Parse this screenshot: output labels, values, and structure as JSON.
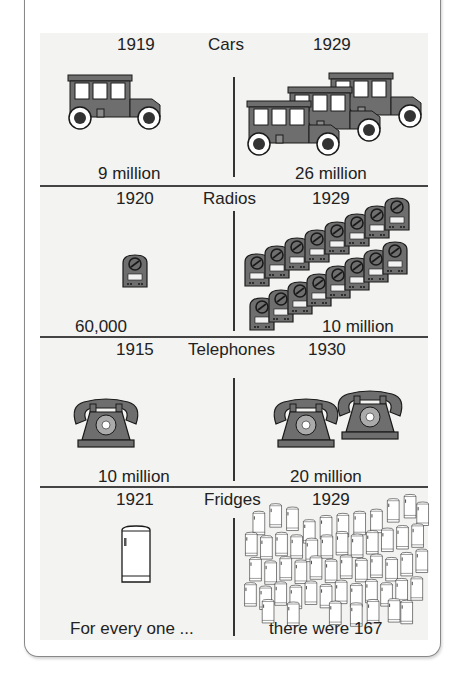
{
  "intro_text": "the 1920s.",
  "colors": {
    "panel_bg": "#f3f3f1",
    "icon_fill": "#6e6e6e",
    "icon_stroke": "#1a1a1a",
    "divider": "#444444"
  },
  "sections": [
    {
      "category": "Cars",
      "left_year": "1919",
      "right_year": "1929",
      "left_value": "9 million",
      "right_value": "26 million",
      "left_icon": "car-icon",
      "left_icon_count": 1,
      "right_icon_count": 3
    },
    {
      "category": "Radios",
      "left_year": "1920",
      "right_year": "1929",
      "left_value": "60,000",
      "right_value": "10 million",
      "left_icon": "radio-icon",
      "left_icon_count": 1,
      "right_icon_count": 16
    },
    {
      "category": "Telephones",
      "left_year": "1915",
      "right_year": "1930",
      "left_value": "10 million",
      "right_value": "20 million",
      "left_icon": "telephone-icon",
      "left_icon_count": 1,
      "right_icon_count": 2
    },
    {
      "category": "Fridges",
      "left_year": "1921",
      "right_year": "1929",
      "left_value": "For every one ...",
      "right_value": "there were 167",
      "left_icon": "fridge-icon",
      "left_icon_count": 1,
      "right_icon_count": 167
    }
  ]
}
